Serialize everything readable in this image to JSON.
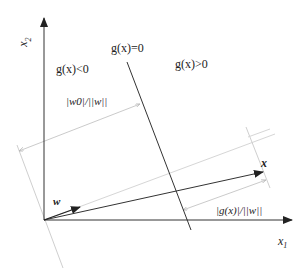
{
  "diagram": {
    "type": "linear discriminant function geometry",
    "axes": {
      "x_label": "x",
      "x_sub": "1",
      "y_label": "x",
      "y_sub": "2"
    },
    "regions": {
      "boundary": "g(x)=0",
      "negative": "g(x)<0",
      "positive": "g(x)>0"
    },
    "vectors": {
      "weight": "w",
      "point": "x"
    },
    "distances": {
      "origin_to_boundary": "|w0|/||w||",
      "point_to_boundary": "|g(x)|/||w||"
    },
    "colors": {
      "main_line": "#333333",
      "guide_line": "#c8c8c8"
    }
  }
}
